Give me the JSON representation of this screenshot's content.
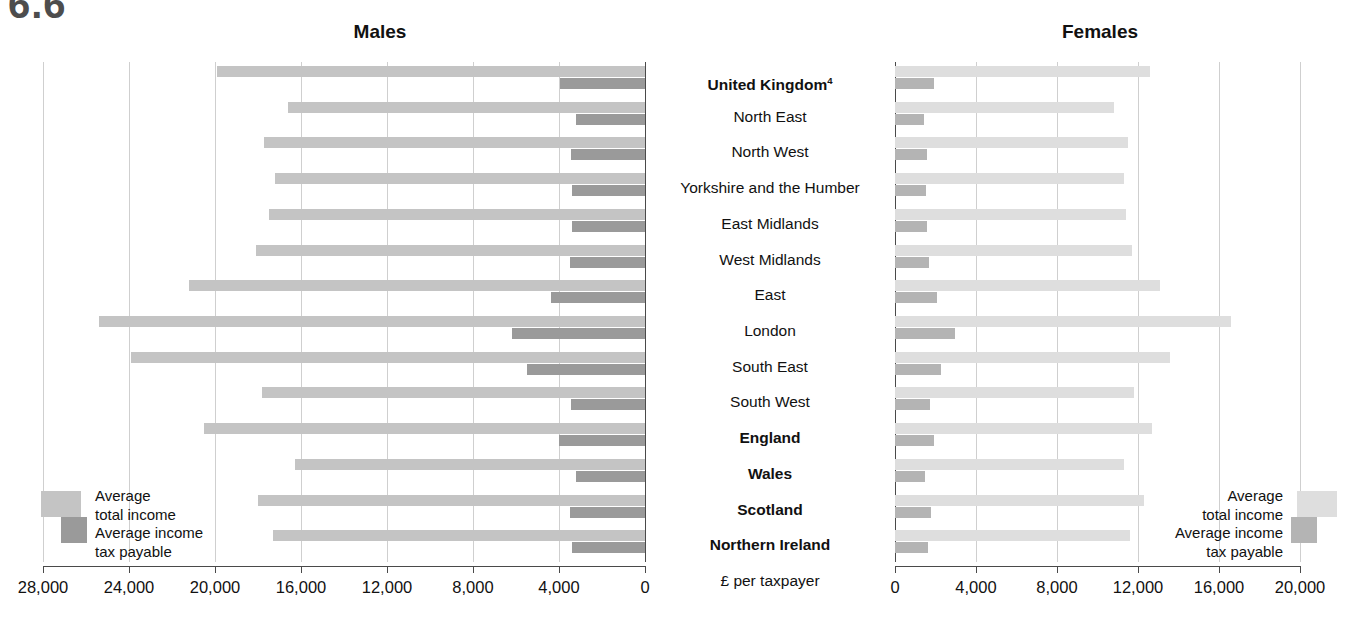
{
  "figure_tag": "6.6",
  "panels": {
    "males": {
      "title": "Males"
    },
    "females": {
      "title": "Females"
    }
  },
  "unit_label": "£ per taxpayer",
  "legend": {
    "total_line1": "Average",
    "total_line2": "total income",
    "tax_line1": "Average income",
    "tax_line2": "tax payable",
    "swatch_total_color_males": "#c4c4c4",
    "swatch_tax_color_males": "#9a9a9a",
    "swatch_total_color_females": "#dedede",
    "swatch_tax_color_females": "#b4b4b4"
  },
  "chart_data": {
    "type": "bar",
    "xlabel": "£ per taxpayer",
    "ylabel": "",
    "orientation": "horizontal",
    "layout": "back-to-back (butterfly) paired panels",
    "grid": true,
    "legend_position": "bottom-left (Males panel) and bottom-right (Females panel)",
    "panels": [
      "Males",
      "Females"
    ],
    "categories": [
      "United Kingdom⁴",
      "North East",
      "North West",
      "Yorkshire and the Humber",
      "East Midlands",
      "West Midlands",
      "East",
      "London",
      "South East",
      "South West",
      "England",
      "Wales",
      "Scotland",
      "Northern Ireland"
    ],
    "categories_bold": [
      "United Kingdom⁴",
      "England",
      "Wales",
      "Scotland",
      "Northern Ireland"
    ],
    "males": {
      "axis": {
        "label": "Males",
        "ticks": [
          28000,
          24000,
          20000,
          16000,
          12000,
          8000,
          4000,
          0
        ],
        "tick_labels": [
          "28,000",
          "24,000",
          "20,000",
          "16,000",
          "12,000",
          "8,000",
          "4,000",
          "0"
        ],
        "xlim": [
          28000,
          0
        ],
        "direction": "right-to-left"
      },
      "series": [
        {
          "name": "Average total income",
          "values": [
            19900,
            16600,
            17700,
            17200,
            17500,
            18100,
            21200,
            25400,
            23900,
            17800,
            20500,
            16300,
            18000,
            17300
          ]
        },
        {
          "name": "Average income tax payable",
          "values": [
            3950,
            3200,
            3450,
            3400,
            3400,
            3500,
            4350,
            6200,
            5500,
            3450,
            4000,
            3200,
            3500,
            3400
          ]
        }
      ]
    },
    "females": {
      "axis": {
        "label": "Females",
        "ticks": [
          0,
          4000,
          8000,
          12000,
          16000,
          20000
        ],
        "tick_labels": [
          "0",
          "4,000",
          "8,000",
          "12,000",
          "16,000",
          "20,000"
        ],
        "xlim": [
          0,
          20000
        ],
        "direction": "left-to-right"
      },
      "series": [
        {
          "name": "Average total income",
          "values": [
            12600,
            10800,
            11500,
            11300,
            11400,
            11700,
            13100,
            16600,
            13600,
            11800,
            12700,
            11300,
            12300,
            11600
          ]
        },
        {
          "name": "Average income tax payable",
          "values": [
            1950,
            1450,
            1600,
            1550,
            1600,
            1700,
            2050,
            2950,
            2250,
            1750,
            1950,
            1500,
            1800,
            1650
          ]
        }
      ]
    }
  }
}
